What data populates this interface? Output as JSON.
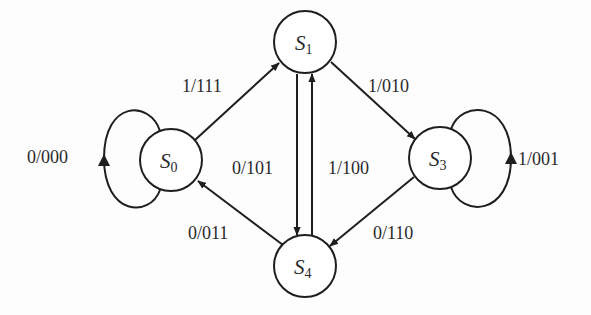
{
  "diagram": {
    "type": "state-transition-diagram",
    "states": [
      {
        "id": "S0",
        "letter": "S",
        "sub": "0",
        "cx": 171,
        "cy": 160
      },
      {
        "id": "S1",
        "letter": "S",
        "sub": "1",
        "cx": 305,
        "cy": 42
      },
      {
        "id": "S3",
        "letter": "S",
        "sub": "3",
        "cx": 440,
        "cy": 158
      },
      {
        "id": "S4",
        "letter": "S",
        "sub": "4",
        "cx": 305,
        "cy": 266
      }
    ],
    "transitions": [
      {
        "from": "S0",
        "to": "S0",
        "label": "0/000"
      },
      {
        "from": "S0",
        "to": "S1",
        "label": "1/111"
      },
      {
        "from": "S1",
        "to": "S3",
        "label": "1/010"
      },
      {
        "from": "S1",
        "to": "S4",
        "label": "0/101"
      },
      {
        "from": "S4",
        "to": "S1",
        "label": "1/100"
      },
      {
        "from": "S3",
        "to": "S3",
        "label": "1/001"
      },
      {
        "from": "S3",
        "to": "S4",
        "label": "0/110"
      },
      {
        "from": "S4",
        "to": "S0",
        "label": "0/011"
      }
    ],
    "colors": {
      "line": "#1e1e1e",
      "text": "#2a2a2a",
      "background": "#fdfdfd"
    }
  }
}
